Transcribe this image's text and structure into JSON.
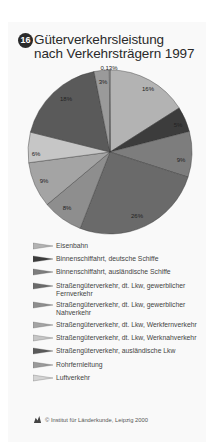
{
  "header": {
    "badge": "16",
    "title_line1": "Güterverkehrsleistung",
    "title_line2": "nach Verkehrsträgern 1997"
  },
  "chart_data": {
    "type": "pie",
    "title": "Güterverkehrsleistung nach Verkehrsträgern 1997",
    "start_angle": "12 o'clock, clockwise",
    "slices": [
      {
        "label": "Eisenbahn",
        "value": 16,
        "display": "16%",
        "color": "#b3b3b3"
      },
      {
        "label": "Binnenschiffahrt, deutsche Schiffe",
        "value": 5,
        "display": "5%",
        "color": "#3c3c3c"
      },
      {
        "label": "Binnenschiffahrt, ausländische Schiffe",
        "value": 9,
        "display": "9%",
        "color": "#7d7d7d"
      },
      {
        "label": "Straßengüterverkehr, dt. Lkw, gewerblicher Fernverkehr",
        "value": 26,
        "display": "26%",
        "color": "#6a6a6a"
      },
      {
        "label": "Straßengüterverkehr, dt. Lkw, gewerblicher Nahverkehr",
        "value": 8,
        "display": "8%",
        "color": "#8e8e8e"
      },
      {
        "label": "Straßengüterverkehr, dt. Lkw, Werkfernverkehr",
        "value": 9,
        "display": "9%",
        "color": "#a4a4a4"
      },
      {
        "label": "Straßengüterverkehr, dt. Lkw, Werknahverkehr",
        "value": 6,
        "display": "6%",
        "color": "#c6c6c6"
      },
      {
        "label": "Straßengüterverkehr, ausländische Lkw",
        "value": 18,
        "display": "18%",
        "color": "#5a5a5a"
      },
      {
        "label": "Rohrfernleitung",
        "value": 3,
        "display": "3%",
        "color": "#9a9a9a"
      },
      {
        "label": "Luftverkehr",
        "value": 0.13,
        "display": "0,13%",
        "color": "#d4d4d4"
      }
    ]
  },
  "legend": {
    "items": [
      {
        "line1": "Eisenbahn",
        "line2": ""
      },
      {
        "line1": "Binnenschiffahrt, deutsche Schiffe",
        "line2": ""
      },
      {
        "line1": "Binnenschiffahrt, ausländische Schiffe",
        "line2": ""
      },
      {
        "line1": "Straßengüterverkehr, dt. Lkw, gewerblicher",
        "line2": "Fernverkehr"
      },
      {
        "line1": "Straßengüterverkehr, dt. Lkw, gewerblicher",
        "line2": "Nahverkehr"
      },
      {
        "line1": "Straßengüterverkehr, dt. Lkw, Werkfernverkehr",
        "line2": ""
      },
      {
        "line1": "Straßengüterverkehr, dt. Lkw, Werknahverkehr",
        "line2": ""
      },
      {
        "line1": "Straßengüterverkehr, ausländische Lkw",
        "line2": ""
      },
      {
        "line1": "Rohrfernleitung",
        "line2": ""
      },
      {
        "line1": "Luftverkehr",
        "line2": ""
      }
    ]
  },
  "credit": {
    "text": "© Institut für Länderkunde, Leipzig 2000"
  }
}
